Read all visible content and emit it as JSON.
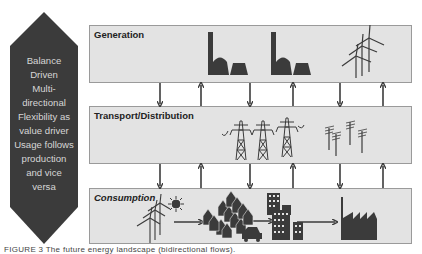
{
  "diagram": {
    "side_panel": {
      "shape": "elongated-hexagon",
      "color": "#3b3b3b",
      "text_color": "#d6d6d6",
      "lines": [
        "Balance",
        "Driven",
        "Multi-",
        "directional",
        "Flexibility as",
        "value driver",
        "Usage follows",
        "production",
        "and vice",
        "versa"
      ]
    },
    "layers": [
      {
        "label": "Generation",
        "italic": false,
        "icons": [
          "power-plant",
          "power-plant",
          "wind-turbines"
        ]
      },
      {
        "label": "Transport/Distribution",
        "italic": false,
        "icons": [
          "pylon",
          "pylon",
          "pylon",
          "utility-poles"
        ]
      },
      {
        "label": "Consumption",
        "italic": true,
        "icons": [
          "wind-turbines",
          "sun",
          "houses",
          "car",
          "apartment-buildings",
          "factory"
        ]
      }
    ],
    "connections": {
      "between": [
        [
          "Generation",
          "Transport/Distribution"
        ],
        [
          "Transport/Distribution",
          "Consumption"
        ]
      ],
      "arrows": [
        "down",
        "up",
        "down",
        "up",
        "down",
        "up"
      ]
    },
    "flow_arrows_in_consumption": [
      "wind-turbines → houses",
      "houses → apartment-buildings",
      "apartment-buildings → factory"
    ],
    "colors": {
      "box_fill": "#e3e3e3",
      "box_border": "#9a9a9a",
      "arrow": "#3b3b3b",
      "icon": "#3b3b3b"
    }
  },
  "caption": "FIGURE 3   The future energy landscape (bidirectional flows)."
}
